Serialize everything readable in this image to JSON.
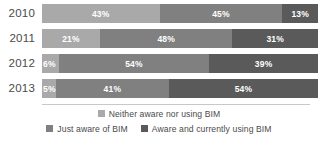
{
  "chart_data": {
    "type": "bar",
    "orientation": "horizontal",
    "stacked": true,
    "normalized": "100%",
    "title": "",
    "subtitle": "",
    "xlabel": "",
    "ylabel": "",
    "xlim": [
      0,
      100
    ],
    "grid": false,
    "legend_position": "bottom",
    "categories": [
      "2010",
      "2011",
      "2012",
      "2013"
    ],
    "series": [
      {
        "name": "Neither aware nor using BIM",
        "color": "#a9a9a9",
        "values": [
          43,
          21,
          6,
          5
        ],
        "labels": [
          "43%",
          "21%",
          "6%",
          "5%"
        ]
      },
      {
        "name": "Just aware of BIM",
        "color": "#808080",
        "values": [
          45,
          48,
          54,
          41
        ],
        "labels": [
          "45%",
          "48%",
          "54%",
          "41%"
        ]
      },
      {
        "name": "Aware and currently using BIM",
        "color": "#5a5a5a",
        "values": [
          13,
          31,
          39,
          54
        ],
        "labels": [
          "13%",
          "31%",
          "39%",
          "54%"
        ]
      }
    ]
  },
  "legend": {
    "row1": [
      {
        "label": "Neither aware nor using BIM",
        "color": "#a9a9a9"
      }
    ],
    "row2": [
      {
        "label": "Just aware of BIM",
        "color": "#808080"
      },
      {
        "label": "Aware and currently using BIM",
        "color": "#5a5a5a"
      }
    ]
  }
}
